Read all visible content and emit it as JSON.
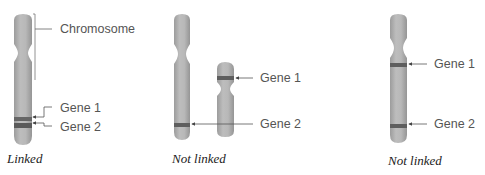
{
  "colors": {
    "chromosome": "#b5b5b5",
    "chromosome_shade": "#9a9a9a",
    "band": "#5e5e5e",
    "leader": "#555555",
    "label": "#555555",
    "caption": "#222222"
  },
  "panels": [
    {
      "caption": "Linked",
      "chromosome_label": "Chromosome",
      "gene1_label": "Gene 1",
      "gene2_label": "Gene 2"
    },
    {
      "caption": "Not linked",
      "gene1_label": "Gene 1",
      "gene2_label": "Gene 2"
    },
    {
      "caption": "Not linked",
      "gene1_label": "Gene 1",
      "gene2_label": "Gene 2"
    }
  ]
}
